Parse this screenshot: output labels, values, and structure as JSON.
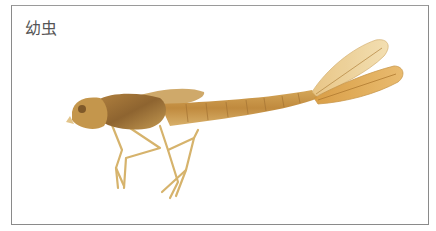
{
  "figure": {
    "caption": "幼虫",
    "colors": {
      "border": "#8a8a8a",
      "body": "#c89a4a",
      "body_dark": "#9c6a2c",
      "legs": "#d8b46a",
      "gills": "#e8c88a",
      "caption_text": "#555555"
    }
  }
}
